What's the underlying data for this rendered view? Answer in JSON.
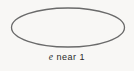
{
  "figure": {
    "type": "ellipse-diagram",
    "caption": {
      "symbol": "e",
      "text": "near 1",
      "full": "e near 1"
    },
    "colors": {
      "background": "#f8f7f5",
      "ellipse_stroke": "#6a6a6a",
      "caption_text": "#2a2a2a"
    },
    "ellipse": {
      "description": "wide flat ellipse outline illustrating eccentricity near 1"
    }
  }
}
